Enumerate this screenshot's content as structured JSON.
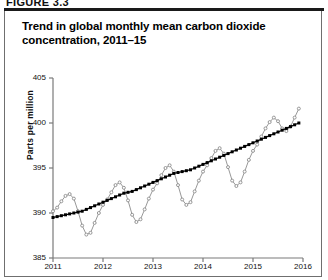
{
  "figure": {
    "number_label": "FIGURE 3.3",
    "title": "Trend in global monthly mean carbon dioxide concentration, 2011–15"
  },
  "chart_data": {
    "type": "line",
    "title": "Trend in global monthly mean carbon dioxide concentration, 2011–15",
    "xlabel": "",
    "ylabel": "Parts per million",
    "ylim": [
      385,
      405
    ],
    "xlim": [
      2011,
      2016
    ],
    "ytick_labels": [
      "385",
      "390",
      "395",
      "400",
      "405"
    ],
    "ytick_values": [
      385,
      390,
      395,
      400,
      405
    ],
    "xtick_labels": [
      "2011",
      "2012",
      "2013",
      "2014",
      "2015",
      "2016"
    ],
    "xtick_values": [
      2011,
      2012,
      2013,
      2014,
      2015,
      2016
    ],
    "grid": false,
    "legend": "none",
    "series": [
      {
        "name": "Monthly mean",
        "marker": "open-circle",
        "color": "#8c8c8c",
        "x": [
          2011.0,
          2011.083,
          2011.167,
          2011.25,
          2011.333,
          2011.417,
          2011.5,
          2011.583,
          2011.667,
          2011.75,
          2011.833,
          2011.917,
          2012.0,
          2012.083,
          2012.167,
          2012.25,
          2012.333,
          2012.417,
          2012.5,
          2012.583,
          2012.667,
          2012.75,
          2012.833,
          2012.917,
          2013.0,
          2013.083,
          2013.167,
          2013.25,
          2013.333,
          2013.417,
          2013.5,
          2013.583,
          2013.667,
          2013.75,
          2013.833,
          2013.917,
          2014.0,
          2014.083,
          2014.167,
          2014.25,
          2014.333,
          2014.417,
          2014.5,
          2014.583,
          2014.667,
          2014.75,
          2014.833,
          2014.917,
          2015.0,
          2015.083,
          2015.167,
          2015.25,
          2015.333,
          2015.417,
          2015.5,
          2015.583,
          2015.667,
          2015.75,
          2015.833,
          2015.917
        ],
        "values": [
          390.2,
          390.6,
          391.3,
          391.9,
          392.1,
          391.6,
          390.2,
          388.6,
          387.6,
          387.8,
          388.9,
          390.0,
          390.9,
          391.5,
          392.3,
          393.1,
          393.4,
          392.8,
          391.4,
          389.8,
          389.0,
          389.3,
          390.4,
          391.6,
          392.6,
          393.3,
          394.2,
          395.0,
          395.3,
          394.6,
          393.1,
          391.5,
          390.9,
          391.2,
          392.4,
          393.6,
          394.6,
          395.3,
          396.1,
          396.9,
          397.2,
          396.6,
          395.1,
          393.6,
          393.0,
          393.4,
          394.6,
          395.9,
          396.9,
          397.6,
          398.5,
          399.4,
          400.1,
          400.6,
          400.2,
          399.4,
          399.1,
          399.6,
          400.6,
          401.6
        ]
      },
      {
        "name": "Trend",
        "marker": "filled-square",
        "color": "#000000",
        "x": [
          2011.0,
          2011.083,
          2011.167,
          2011.25,
          2011.333,
          2011.417,
          2011.5,
          2011.583,
          2011.667,
          2011.75,
          2011.833,
          2011.917,
          2012.0,
          2012.083,
          2012.167,
          2012.25,
          2012.333,
          2012.417,
          2012.5,
          2012.583,
          2012.667,
          2012.75,
          2012.833,
          2012.917,
          2013.0,
          2013.083,
          2013.167,
          2013.25,
          2013.333,
          2013.417,
          2013.5,
          2013.583,
          2013.667,
          2013.75,
          2013.833,
          2013.917,
          2014.0,
          2014.083,
          2014.167,
          2014.25,
          2014.333,
          2014.417,
          2014.5,
          2014.583,
          2014.667,
          2014.75,
          2014.833,
          2014.917,
          2015.0,
          2015.083,
          2015.167,
          2015.25,
          2015.333,
          2015.417,
          2015.5,
          2015.583,
          2015.667,
          2015.75,
          2015.833,
          2015.917
        ],
        "values": [
          389.5,
          389.6,
          389.7,
          389.8,
          389.9,
          390.0,
          390.1,
          390.2,
          390.4,
          390.6,
          390.8,
          391.0,
          391.2,
          391.4,
          391.6,
          391.8,
          392.0,
          392.2,
          392.3,
          392.4,
          392.6,
          392.8,
          393.0,
          393.2,
          393.4,
          393.6,
          393.8,
          394.0,
          394.2,
          394.4,
          394.5,
          394.6,
          394.7,
          394.8,
          395.0,
          395.2,
          395.4,
          395.6,
          395.8,
          396.0,
          396.2,
          396.4,
          396.6,
          396.8,
          397.0,
          397.2,
          397.4,
          397.6,
          397.8,
          398.0,
          398.2,
          398.4,
          398.6,
          398.8,
          399.0,
          399.2,
          399.4,
          399.6,
          399.8,
          400.0
        ]
      }
    ]
  },
  "colors": {
    "trend": "#000000",
    "monthly": "#8c8c8c",
    "axis": "#7a7a7a",
    "rule": "#1a1a1a"
  }
}
